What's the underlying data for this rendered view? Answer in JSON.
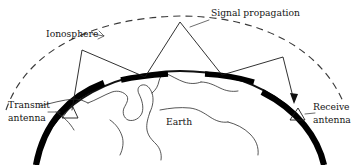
{
  "figure": {
    "background_color": "#ffffff",
    "ink_color": "#111111",
    "width": 358,
    "height": 165
  },
  "labels": {
    "ionosphere": "Ionosphere",
    "signal_propagation": "Signal propagation",
    "transmit_antenna_line1": "Transmit",
    "transmit_antenna_line2": "antenna",
    "receive_antenna_line1": "Receive",
    "receive_antenna_line2": "antenna",
    "earth": "Earth"
  },
  "elements": {
    "ionosphere_layer_name": "dashed-arc",
    "earth_surface_name": "solid-arc",
    "ray_path_name": "zigzag-ray-path",
    "reflection_points": 5,
    "ground_bounce_count": 2,
    "ionosphere_bounce_count": 3
  },
  "geometry": {
    "iono_arc_path": "M 6 110 C 26 52, 90 18, 180 16 C 262 16, 322 50, 344 104",
    "earth_arc_path": "M 36 165 C 46 110, 104 72, 180 71 C 252 71, 312 108, 324 165",
    "earth_thick_left_path": "M 36 165 C 44 122, 70 96, 104 83",
    "earth_thick_right_path": "M 262 92 C 298 110, 318 138, 324 165",
    "ground_patch_left": "M 121 80 C 134 77, 152 75, 168 74",
    "ground_patch_right": "M 205 74 C 222 75, 240 78, 254 82",
    "ray_path": "M 72 110 L 82 50 L 145 77 L 180 22 L 222 75 L 283 57 L 294 101",
    "arrow_tip_x": 294,
    "arrow_tip_y": 104,
    "tx_triangle": "M 62 118 L 72 105 L 78 118 Z",
    "rx_triangle": "M 290 120 L 298 108 L 305 120 Z",
    "ionosphere_leader": "M 92 34 L 104 36 L 99 31 M 104 36 L 98 39",
    "signal_leader": "M 209 20 L 190 27",
    "tx_leader": "M 48 112 L 60 112",
    "rx_leader": "M 305 114 L 315 113"
  },
  "coastlines": [
    "M 40 106 C 52 103, 62 100, 74 99 C 80 99, 84 101, 88 103",
    "M 88 103 C 96 100, 104 95, 112 92 C 118 90, 124 92, 127 96 C 129 100, 126 104, 124 108 C 122 113, 124 118, 128 120 C 134 122, 140 118, 142 113 C 144 107, 142 100, 139 94 C 137 90, 138 86, 142 85 C 147 84, 150 88, 152 93 C 154 99, 153 106, 150 112",
    "M 150 112 C 148 118, 146 124, 147 130 C 148 136, 152 140, 156 144 C 160 148, 162 154, 161 160",
    "M 152 93 C 156 90, 158 86, 159 81 C 160 77, 162 74, 165 73",
    "M 160 110 C 170 108, 180 107, 190 108 C 198 109, 204 113, 210 117 C 216 121, 222 123, 228 122",
    "M 228 122 C 236 124, 244 128, 250 134 C 256 140, 259 147, 258 155",
    "M 165 73 C 172 76, 178 80, 184 82 C 190 84, 196 84, 201 82",
    "M 201 82 C 208 82, 214 85, 220 88 C 226 91, 232 92, 238 91",
    "M 110 120 C 116 124, 120 130, 122 136 C 124 142, 123 149, 120 155",
    "M 56 112 C 64 117, 70 123, 74 130"
  ]
}
